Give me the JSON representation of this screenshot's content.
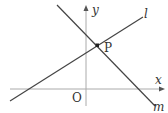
{
  "diagram": {
    "type": "coordinate-lines",
    "axes": {
      "x_label": "x",
      "y_label": "y",
      "origin_label": "O"
    },
    "lines": [
      {
        "name": "l",
        "label": "l",
        "slope_sign": "positive"
      },
      {
        "name": "m",
        "label": "m",
        "slope_sign": "negative"
      }
    ],
    "intersection": {
      "label": "P"
    },
    "colors": {
      "axis": "#aaaaaa",
      "line": "#444444",
      "point": "#222222",
      "text": "#333333"
    }
  }
}
